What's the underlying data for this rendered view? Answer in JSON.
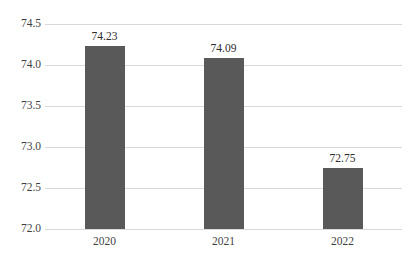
{
  "chart_data": {
    "type": "bar",
    "title": "",
    "subtitle": "",
    "xlabel": "",
    "ylabel": "",
    "categories": [
      "2020",
      "2021",
      "2022"
    ],
    "values": [
      74.23,
      74.09,
      72.75
    ],
    "data_labels": [
      "74.23",
      "74.09",
      "72.75"
    ],
    "ylim": [
      72.0,
      74.5
    ],
    "yticks": [
      72.0,
      72.5,
      73.0,
      73.5,
      74.0,
      74.5
    ],
    "ytick_labels": [
      "72.0",
      "72.5",
      "73.0",
      "73.5",
      "74.0",
      "74.5"
    ],
    "grid": "horizontal",
    "legend": "none",
    "series": [
      {
        "name": "",
        "values": [
          74.23,
          74.09,
          72.75
        ],
        "color": "#595959"
      }
    ],
    "colors": {
      "bar": "#595959",
      "gridline": "#d9d9d9",
      "tick_text": "#3f3f3f",
      "label_text": "#2b2b2b",
      "background": "#ffffff"
    }
  }
}
